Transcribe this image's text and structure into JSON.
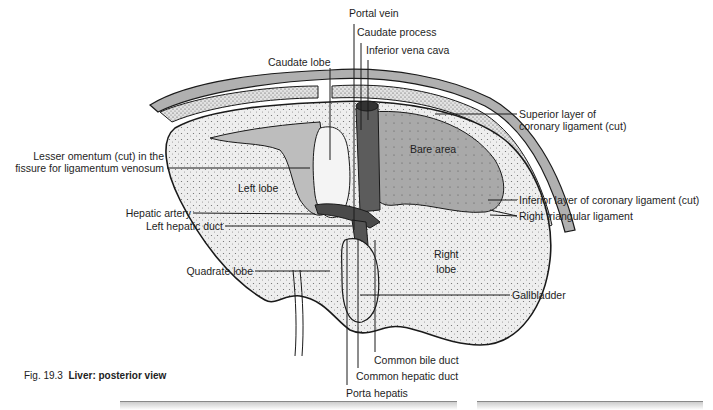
{
  "figure": {
    "number": "Fig. 19.3",
    "title": "Liver: posterior view"
  },
  "regions": {
    "left_lobe": "Left lobe",
    "right_lobe_line1": "Right",
    "right_lobe_line2": "lobe",
    "bare_area": "Bare area"
  },
  "labels": {
    "portal_vein": "Portal vein",
    "caudate_process": "Caudate process",
    "inferior_vena_cava": "Inferior vena cava",
    "caudate_lobe": "Caudate lobe",
    "superior_layer_line1": "Superior layer of",
    "superior_layer_line2": "coronary ligament (cut)",
    "lesser_omentum_line1": "Lesser omentum (cut) in the",
    "lesser_omentum_line2": "fissure for ligamentum venosum",
    "inferior_layer": "Inferior layer of coronary ligament (cut)",
    "right_triangular": "Right triangular ligament",
    "hepatic_artery": "Hepatic artery",
    "left_hepatic_duct": "Left hepatic duct",
    "quadrate_lobe": "Quadrate lobe",
    "gallbladder": "Gallbladder",
    "common_bile_duct": "Common bile duct",
    "common_hepatic_duct": "Common hepatic duct",
    "porta_hepatis": "Porta hepatis"
  },
  "colors": {
    "outline": "#1a1a1a",
    "liver_fill": "#ececec",
    "bare_area_fill": "#a9a9a9",
    "ivc_fill": "#5c5c5c",
    "diaphragm_fill": "#b8b8b8",
    "omentum_fill": "#bdbdbd"
  }
}
